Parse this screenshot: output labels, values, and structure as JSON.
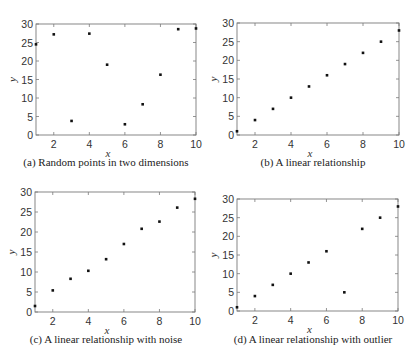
{
  "chart_data": [
    {
      "id": "a",
      "type": "scatter",
      "title": "",
      "caption": "(a) Random points in two dimensions",
      "xlabel": "x",
      "ylabel": "y",
      "xlim": [
        1,
        10
      ],
      "ylim": [
        0,
        30
      ],
      "xticks": [
        2,
        4,
        6,
        8,
        10
      ],
      "yticks": [
        0,
        5,
        10,
        15,
        20,
        25,
        30
      ],
      "grid": false,
      "legend": null,
      "x": [
        1,
        2,
        3,
        4,
        5,
        6,
        7,
        8,
        9,
        10
      ],
      "y": [
        24.5,
        27.2,
        3.8,
        27.4,
        19.0,
        2.9,
        8.3,
        16.3,
        28.6,
        28.8
      ],
      "box": {
        "left": 36,
        "right": 196,
        "top": 24,
        "bottom": 135
      }
    },
    {
      "id": "b",
      "type": "scatter",
      "title": "",
      "caption": "(b) A linear relationship",
      "xlabel": "x",
      "ylabel": "y",
      "xlim": [
        1,
        10
      ],
      "ylim": [
        0,
        30
      ],
      "xticks": [
        2,
        4,
        6,
        8,
        10
      ],
      "yticks": [
        0,
        5,
        10,
        15,
        20,
        25,
        30
      ],
      "grid": false,
      "legend": null,
      "x": [
        1,
        2,
        3,
        4,
        5,
        6,
        7,
        8,
        9,
        10
      ],
      "y": [
        1,
        4,
        7,
        10,
        13,
        16,
        19,
        22,
        25,
        28
      ],
      "box": {
        "left": 237,
        "right": 399,
        "top": 23,
        "bottom": 135
      }
    },
    {
      "id": "c",
      "type": "scatter",
      "title": "",
      "caption": "(c) A linear relationship with noise",
      "xlabel": "x",
      "ylabel": "y",
      "xlim": [
        1,
        10
      ],
      "ylim": [
        0,
        30
      ],
      "xticks": [
        2,
        4,
        6,
        8,
        10
      ],
      "yticks": [
        0,
        5,
        10,
        15,
        20,
        25,
        30
      ],
      "grid": false,
      "legend": null,
      "x": [
        1,
        2,
        3,
        4,
        5,
        6,
        7,
        8,
        9,
        10
      ],
      "y": [
        1.5,
        5.4,
        8.3,
        10.3,
        13.2,
        17.0,
        20.8,
        22.6,
        26.1,
        28.3
      ],
      "box": {
        "left": 35,
        "right": 195,
        "top": 192,
        "bottom": 312
      }
    },
    {
      "id": "d",
      "type": "scatter",
      "title": "",
      "caption": "(d) A linear relationship with outlier",
      "xlabel": "x",
      "ylabel": "y",
      "xlim": [
        1,
        10
      ],
      "ylim": [
        0,
        30
      ],
      "xticks": [
        2,
        4,
        6,
        8,
        10
      ],
      "yticks": [
        0,
        5,
        10,
        15,
        20,
        25,
        30
      ],
      "grid": false,
      "legend": null,
      "x": [
        1,
        2,
        3,
        4,
        5,
        6,
        7,
        8,
        9,
        10
      ],
      "y": [
        1,
        4,
        7,
        10,
        13,
        16,
        5,
        22,
        25,
        28
      ],
      "box": {
        "left": 237,
        "right": 398,
        "top": 199,
        "bottom": 311
      }
    }
  ],
  "captions": {
    "a": "(a) Random points in two dimensions",
    "b": "(b) A linear relationship",
    "c": "(c) A linear relationship with noise",
    "d": "(d) A linear relationship with outlier"
  },
  "colors": {
    "axis": "#7a7a7a",
    "marker": "#111111",
    "text": "#333333"
  }
}
